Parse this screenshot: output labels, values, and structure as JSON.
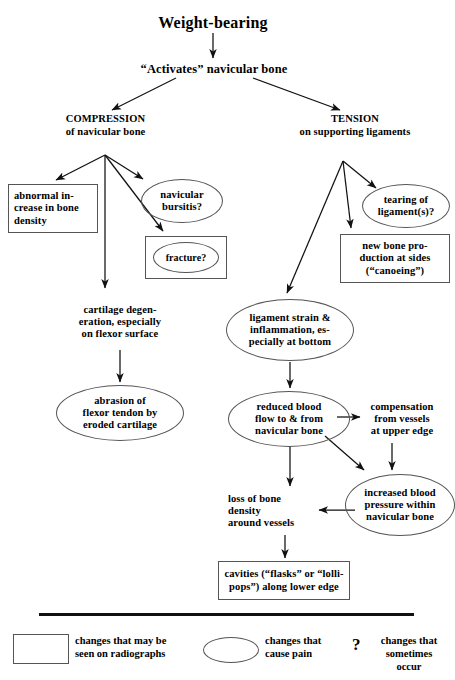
{
  "title": "Weight-bearing",
  "activates": "“Activates” navicular bone",
  "branches": {
    "left": "COMPRESSION\nof navicular bone",
    "right": "TENSION\non supporting ligaments"
  },
  "nodes": {
    "abnormal_increase": "abnormal in-\ncrease in bone\ndensity",
    "navicular_bursitis": "navicular\nbursitis?",
    "fracture": "fracture?",
    "cartilage_degeneration": "cartilage degen-\neration, especially\non flexor surface",
    "abrasion": "abrasion of\nflexor tendon by\neroded cartilage",
    "tearing": "tearing of\nligament(s)?",
    "new_bone": "new bone pro-\nduction at sides\n(“canoeing”)",
    "ligament_strain": "ligament strain &\ninflammation, es-\npecially at bottom",
    "reduced_blood_flow": "reduced blood\nflow to & from\nnavicular bone",
    "compensation": "compensation\nfrom vessels\nat upper edge",
    "increased_pressure": "increased blood\npressure within\nnavicular bone",
    "loss_of_bone": "loss of bone\ndensity\naround vessels",
    "cavities": "cavities (“flasks” or “lolli-\npops”) along lower edge"
  },
  "legend": {
    "rect_label": "changes that may be\nseen on radiographs",
    "ellipse_label": "changes that\ncause pain",
    "qmark_symbol": "?",
    "qmark_label": "changes that\nsometimes\noccur"
  },
  "colors": {
    "stroke": "#555555",
    "line": "#111111",
    "text": "#000000",
    "background": "#ffffff"
  }
}
